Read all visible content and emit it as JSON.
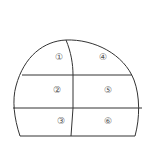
{
  "diagram": {
    "title": "",
    "stroke_color": "#333333",
    "label_color": "#555555",
    "sections": [
      {
        "id": 1,
        "label": "①",
        "x": 55,
        "y": 60
      },
      {
        "id": 2,
        "label": "②",
        "x": 53,
        "y": 93
      },
      {
        "id": 3,
        "label": "③",
        "x": 57,
        "y": 124
      },
      {
        "id": 4,
        "label": "④",
        "x": 99,
        "y": 60
      },
      {
        "id": 5,
        "label": "⑤",
        "x": 104,
        "y": 93
      },
      {
        "id": 6,
        "label": "⑥",
        "x": 104,
        "y": 124
      }
    ]
  }
}
